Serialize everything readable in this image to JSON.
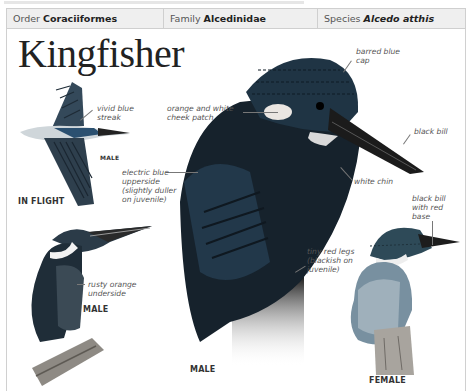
{
  "header": {
    "cells": [
      {
        "label": "Order",
        "value": "Coraciiformes"
      },
      {
        "label": "Family",
        "value": "Alcedinidae"
      },
      {
        "label": "Species",
        "value": "Alcedo atthis"
      }
    ]
  },
  "title": "Kingfisher",
  "annotations": {
    "vivid_blue_streak": [
      "vivid blue",
      "streak"
    ],
    "cheek_patch": [
      "orange and white",
      "cheek patch"
    ],
    "barred_cap": [
      "barred blue",
      "cap"
    ],
    "black_bill": "black bill",
    "white_chin": "white chin",
    "electric_blue": [
      "electric blue",
      "upperside",
      "(slightly duller",
      "on juvenile)"
    ],
    "rusty_orange": [
      "rusty orange",
      "underside"
    ],
    "red_legs": [
      "tiny red legs",
      "(blackish on",
      "juvenile)"
    ],
    "black_bill_red_base": [
      "black bill",
      "with red",
      "base"
    ]
  },
  "captions": {
    "flight_sex": "MALE",
    "in_flight": "IN FLIGHT",
    "left_perched": "MALE",
    "center": "MALE",
    "female": "FEMALE"
  },
  "colors": {
    "header_bg": "#efefef",
    "border": "#cfcfcf",
    "bird_dark": "#1c2630",
    "bird_blue": "#2a4f6a",
    "orange": "#b7653a"
  }
}
